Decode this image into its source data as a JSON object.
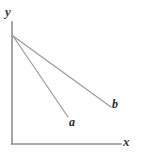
{
  "figure": {
    "kind": "line-diagram",
    "background_color": "#ffffff",
    "axes": {
      "axis_color": "#8f8f8f",
      "axis_stroke_width": 1.6,
      "origin": {
        "x": 12,
        "y": 144
      },
      "y_axis": {
        "label": "y",
        "label_style": "italic",
        "from": {
          "x": 12,
          "y": 22
        },
        "to": {
          "x": 12,
          "y": 144
        }
      },
      "x_axis": {
        "label": "x",
        "label_style": "italic",
        "from": {
          "x": 12,
          "y": 144
        },
        "to": {
          "x": 121,
          "y": 144
        }
      }
    },
    "lines": [
      {
        "id": "line-a",
        "label": "a",
        "label_style": "italic",
        "color": "#9a9a9a",
        "stroke_width": 1.2,
        "start": {
          "x": 13,
          "y": 36
        },
        "end": {
          "x": 68,
          "y": 117
        },
        "description": "steeper line from top of y-axis down to label a"
      },
      {
        "id": "line-b",
        "label": "b",
        "label_style": "italic",
        "color": "#9a9a9a",
        "stroke_width": 1.2,
        "start": {
          "x": 13,
          "y": 36
        },
        "end": {
          "x": 111,
          "y": 107
        },
        "description": "shallower line from top of y-axis down to label b"
      }
    ]
  },
  "chart_data": {
    "type": "line",
    "title": "",
    "xlabel": "x",
    "ylabel": "y",
    "grid": false,
    "legend": "inline-end-labels",
    "xlim": [
      0,
      110
    ],
    "ylim": [
      0,
      110
    ],
    "series": [
      {
        "name": "a",
        "x": [
          0,
          50
        ],
        "y": [
          100,
          26
        ],
        "color": "#9a9a9a"
      },
      {
        "name": "b",
        "x": [
          0,
          90
        ],
        "y": [
          100,
          35
        ],
        "color": "#9a9a9a"
      }
    ]
  }
}
